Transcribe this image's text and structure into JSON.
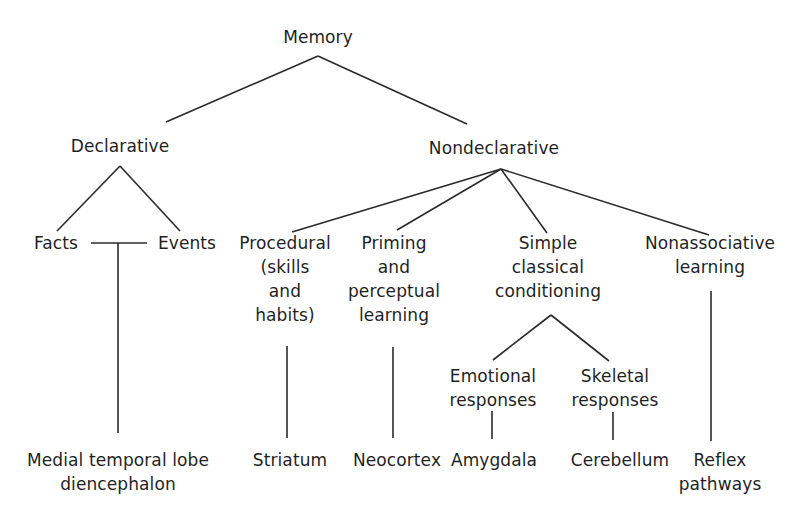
{
  "diagram": {
    "type": "tree",
    "root": {
      "label": "Memory",
      "children": [
        {
          "label": "Declarative",
          "children": [
            {
              "label": "Facts"
            },
            {
              "label": "Events"
            }
          ],
          "substrate": [
            "Medial temporal lobe",
            "diencephalon"
          ]
        },
        {
          "label": "Nondeclarative",
          "children": [
            {
              "label_lines": [
                "Procedural",
                "(skills",
                "and",
                "habits)"
              ],
              "substrate": [
                "Striatum"
              ]
            },
            {
              "label_lines": [
                "Priming",
                "and",
                "perceptual",
                "learning"
              ],
              "substrate": [
                "Neocortex"
              ]
            },
            {
              "label_lines": [
                "Simple",
                "classical",
                "conditioning"
              ],
              "children": [
                {
                  "label_lines": [
                    "Emotional",
                    "responses"
                  ],
                  "substrate": [
                    "Amygdala"
                  ]
                },
                {
                  "label_lines": [
                    "Skeletal",
                    "responses"
                  ],
                  "substrate": [
                    "Cerebellum"
                  ]
                }
              ]
            },
            {
              "label_lines": [
                "Nonassociative",
                "learning"
              ],
              "substrate": [
                "Reflex",
                "pathways"
              ]
            }
          ]
        }
      ]
    }
  },
  "nodes": {
    "memory": "Memory",
    "declarative": "Declarative",
    "nondeclarative": "Nondeclarative",
    "facts": "Facts",
    "events": "Events",
    "procedural": [
      "Procedural",
      "(skills",
      "and",
      "habits)"
    ],
    "priming": [
      "Priming",
      "and",
      "perceptual",
      "learning"
    ],
    "simple_classical": [
      "Simple",
      "classical",
      "conditioning"
    ],
    "nonassociative": [
      "Nonassociative",
      "learning"
    ],
    "emotional": [
      "Emotional",
      "responses"
    ],
    "skeletal": [
      "Skeletal",
      "responses"
    ],
    "medial_temporal": [
      "Medial temporal lobe",
      "diencephalon"
    ],
    "striatum": "Striatum",
    "neocortex": "Neocortex",
    "amygdala": "Amygdala",
    "cerebellum": "Cerebellum",
    "reflex": [
      "Reflex",
      "pathways"
    ]
  }
}
